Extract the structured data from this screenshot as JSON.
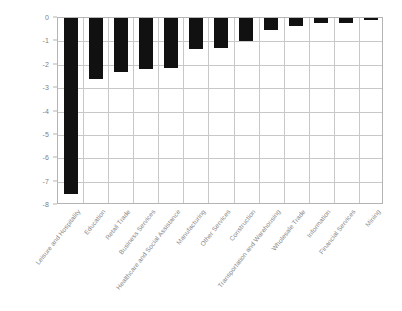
{
  "chart_data": {
    "type": "bar",
    "title": "",
    "subtitle": "",
    "xlabel": "",
    "ylabel": "",
    "ylim": [
      -8,
      0
    ],
    "yticks": [
      "0",
      "-1",
      "-2",
      "-3",
      "-4",
      "-5",
      "-6",
      "-7",
      "-8"
    ],
    "ytick_values": [
      0,
      -1,
      -2,
      -3,
      -4,
      -5,
      -6,
      -7,
      -8
    ],
    "grid": true,
    "legend": "none",
    "orientation": "vertical",
    "bar_color": "#111111",
    "grid_color": "#c8c8c8",
    "axis_color": "#b4b4b4",
    "tick_label_color": "#808080",
    "category_label_color": "#8a8a8a",
    "categories": [
      "Leisure and Hospitality",
      "Education",
      "Retail Trade",
      "Business Services",
      "Healthcare and Social Assistance",
      "Manufacturing",
      "Other Services",
      "Construction",
      "Transportation and Warehousing",
      "Wholesale Trade",
      "Information",
      "Financial Services",
      "Mining"
    ],
    "values": [
      -7.55,
      -2.6,
      -2.3,
      -2.17,
      -2.12,
      -1.33,
      -1.28,
      -0.97,
      -0.5,
      -0.33,
      -0.22,
      -0.2,
      -0.05
    ]
  }
}
